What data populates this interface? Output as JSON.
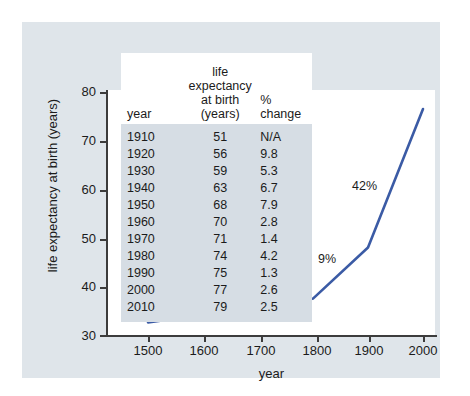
{
  "chart_data": {
    "type": "line",
    "title": "",
    "xlabel": "year",
    "ylabel": "life expectancy at birth (years)",
    "xlim": [
      1400,
      2050
    ],
    "ylim": [
      30,
      80
    ],
    "xticks": [
      "1500",
      "1600",
      "1700",
      "1800",
      "1900",
      "2000"
    ],
    "yticks": [
      "30",
      "40",
      "50",
      "60",
      "70",
      "80"
    ],
    "grid": false,
    "legend": "none",
    "line_color": "#3b5ba5",
    "x": [
      1500,
      1600,
      1700,
      1800,
      1900,
      2000
    ],
    "values": [
      32.6,
      34.2,
      34.4,
      37.5,
      48.0,
      76.5
    ],
    "point_annotations": [
      "3%",
      "0%",
      "8%",
      "9%",
      "42%"
    ],
    "table": {
      "columns": [
        "year",
        "life expectancy at birth (years)",
        "% change"
      ],
      "column_headers_wrapped": [
        "year",
        "life expectancy|at birth (years)",
        "% change"
      ],
      "rows": [
        {
          "year": "1910",
          "life_expectancy": "51",
          "pct_change": "N/A"
        },
        {
          "year": "1920",
          "life_expectancy": "56",
          "pct_change": "9.8"
        },
        {
          "year": "1930",
          "life_expectancy": "59",
          "pct_change": "5.3"
        },
        {
          "year": "1940",
          "life_expectancy": "63",
          "pct_change": "6.7"
        },
        {
          "year": "1950",
          "life_expectancy": "68",
          "pct_change": "7.9"
        },
        {
          "year": "1960",
          "life_expectancy": "70",
          "pct_change": "2.8"
        },
        {
          "year": "1970",
          "life_expectancy": "71",
          "pct_change": "1.4"
        },
        {
          "year": "1980",
          "life_expectancy": "74",
          "pct_change": "4.2"
        },
        {
          "year": "1990",
          "life_expectancy": "75",
          "pct_change": "1.3"
        },
        {
          "year": "2000",
          "life_expectancy": "77",
          "pct_change": "2.6"
        },
        {
          "year": "2010",
          "life_expectancy": "79",
          "pct_change": "2.5"
        }
      ]
    }
  },
  "axes": {
    "ylabel": "life expectancy at birth (years)",
    "xlabel": "year",
    "yticks": [
      {
        "label": "80",
        "top": 70
      },
      {
        "label": "70",
        "top": 119
      },
      {
        "label": "60",
        "top": 168
      },
      {
        "label": "50",
        "top": 217
      },
      {
        "label": "40",
        "top": 265
      },
      {
        "label": "30",
        "top": 313
      }
    ],
    "xticks": [
      {
        "label": "1500",
        "left": 126
      },
      {
        "label": "1600",
        "left": 182
      },
      {
        "label": "1700",
        "left": 239
      },
      {
        "label": "1800",
        "left": 295
      },
      {
        "label": "1900",
        "left": 347
      },
      {
        "label": "2000",
        "left": 401
      }
    ]
  },
  "table_header": {
    "year": "year",
    "life_expectancy_line1": "life expectancy",
    "life_expectancy_line2": "at birth (years)",
    "pct_change": "% change"
  },
  "annotations": [
    {
      "text": "3%",
      "left": 148,
      "top": 272
    },
    {
      "text": "0%",
      "left": 196,
      "top": 272
    },
    {
      "text": "8%",
      "left": 252,
      "top": 257
    },
    {
      "text": "9%",
      "left": 296,
      "top": 230
    },
    {
      "text": "42%",
      "left": 330,
      "top": 157
    }
  ],
  "colors": {
    "line": "#3b5ba5",
    "panel": "#dfe5ea",
    "plot": "#ffffff",
    "axis": "#3c3c3c",
    "table_body": "#d6dde4",
    "table_header": "#ffffff",
    "text": "#1b1b1b"
  }
}
